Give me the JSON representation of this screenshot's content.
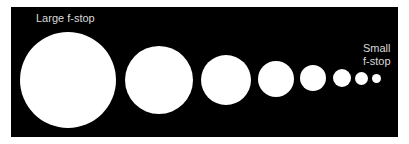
{
  "diagram": {
    "labels": {
      "large": "Large f-stop",
      "small_line1": "Small",
      "small_line2": "f-stop"
    },
    "colors": {
      "background": "#000000",
      "circle": "#ffffff",
      "label": "#d9d9d9"
    },
    "circles": [
      {
        "cx": 68,
        "cy": 80,
        "d": 96
      },
      {
        "cx": 159,
        "cy": 80,
        "d": 68
      },
      {
        "cx": 226,
        "cy": 80,
        "d": 50
      },
      {
        "cx": 276,
        "cy": 79,
        "d": 36
      },
      {
        "cx": 313,
        "cy": 78,
        "d": 26
      },
      {
        "cx": 342,
        "cy": 78,
        "d": 18
      },
      {
        "cx": 361,
        "cy": 78,
        "d": 13
      },
      {
        "cx": 376,
        "cy": 78,
        "d": 9
      }
    ]
  }
}
